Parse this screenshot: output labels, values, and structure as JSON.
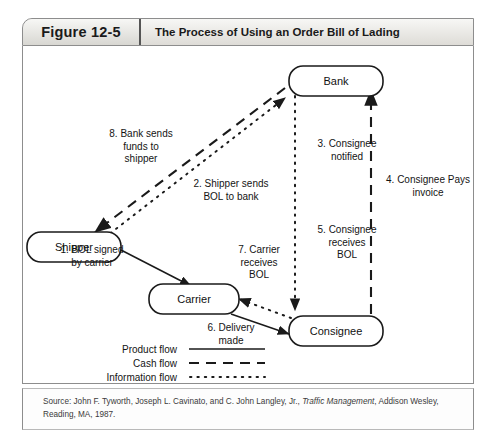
{
  "figure": {
    "number": "Figure 12-5",
    "title": "The Process of Using an Order Bill of Lading"
  },
  "nodes": {
    "bank": "Bank",
    "shipper": "Shipper",
    "carrier": "Carrier",
    "consignee": "Consignee"
  },
  "steps": [
    {
      "id": "step-1",
      "text": "1. BOL signed\nby carrier",
      "flow": "product"
    },
    {
      "id": "step-2",
      "text": "2. Shipper sends\nBOL to bank",
      "flow": "information"
    },
    {
      "id": "step-3",
      "text": "3. Consignee\nnotified",
      "flow": "information"
    },
    {
      "id": "step-4",
      "text": "4. Consignee Pays\ninvoice",
      "flow": "cash"
    },
    {
      "id": "step-5",
      "text": "5. Consignee\nreceives\nBOL",
      "flow": "information"
    },
    {
      "id": "step-6",
      "text": "6. Delivery\nmade",
      "flow": "product"
    },
    {
      "id": "step-7",
      "text": "7. Carrier\nreceives\nBOL",
      "flow": "information"
    },
    {
      "id": "step-8",
      "text": "8. Bank sends\nfunds to\nshipper",
      "flow": "cash"
    }
  ],
  "legend": [
    {
      "label": "Product flow",
      "style": "solid"
    },
    {
      "label": "Cash flow",
      "style": "dashed"
    },
    {
      "label": "Information flow",
      "style": "dotted"
    }
  ],
  "source": {
    "prefix": "Source: John F. Tyworth, Joseph L. Cavinato, and C. John Langley, Jr., ",
    "italic": "Traffic Management",
    "suffix": ", Addison Wesley, Reading, MA, 1987."
  },
  "colors": {
    "line": "#1a1a1a",
    "frame": "#8d8d8d",
    "header_bg": "#e8e7e3"
  }
}
